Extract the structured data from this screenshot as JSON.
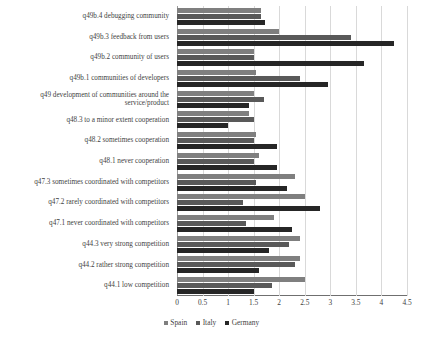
{
  "chart_data": {
    "type": "bar",
    "orientation": "horizontal",
    "title": "",
    "xlabel": "",
    "ylabel": "",
    "xlim": [
      0,
      4.5
    ],
    "xticks": [
      "0",
      "0.5",
      "1",
      "1.5",
      "2",
      "2.5",
      "3",
      "3.5",
      "4",
      "4.5"
    ],
    "xtick_values": [
      0,
      0.5,
      1,
      1.5,
      2,
      2.5,
      3,
      3.5,
      4,
      4.5
    ],
    "grid": true,
    "legend_position": "bottom",
    "categories": [
      "q49b.4 debugging community",
      "q49b.3 feedback from users",
      "q49b.2 community of users",
      "q49b.1 communities of developers",
      "q49 development of communities around the service/product",
      "q48.3 to a minor extent cooperation",
      "q48.2 sometimes cooperation",
      "q48.1 never cooperation",
      "q47.3 sometimes coordinated with competitors",
      "q47.2 rarely coordinated with competitors",
      "q47.1 never coordinated with competitors",
      "q44.3 very strong competition",
      "q44.2 rather strong competition",
      "q44.1 low competition"
    ],
    "series": [
      {
        "name": "Spain",
        "color": "#7f7f7f",
        "values": [
          1.65,
          2.0,
          1.5,
          1.55,
          1.5,
          1.4,
          1.55,
          1.6,
          2.3,
          2.5,
          1.9,
          2.4,
          2.4,
          2.5
        ]
      },
      {
        "name": "Italy",
        "color": "#595959",
        "values": [
          1.65,
          3.4,
          1.5,
          2.4,
          1.7,
          1.5,
          1.5,
          1.5,
          1.55,
          1.3,
          1.35,
          2.2,
          2.3,
          1.85
        ]
      },
      {
        "name": "Germany",
        "color": "#262626",
        "values": [
          1.72,
          4.25,
          3.65,
          2.95,
          1.4,
          1.0,
          1.95,
          1.95,
          2.15,
          2.8,
          2.25,
          1.8,
          1.6,
          1.5
        ]
      }
    ]
  },
  "legend": {
    "items": [
      {
        "label": "Spain"
      },
      {
        "label": "Italy"
      },
      {
        "label": "Germany"
      }
    ]
  }
}
